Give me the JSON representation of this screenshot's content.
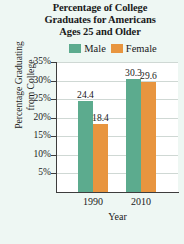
{
  "chart_data": {
    "type": "bar",
    "title": "Percentage of College Graduates for Americans Ages 25 and Older",
    "title_lines": [
      "Percentage of College",
      "Graduates for Americans",
      "Ages 25 and Older"
    ],
    "categories": [
      "1990",
      "2010"
    ],
    "series": [
      {
        "name": "Male",
        "values": [
          24.4,
          18.4
        ],
        "color": "#5cab8e"
      },
      {
        "name": "Female",
        "values": [
          30.3,
          29.6
        ],
        "color": "#e8953f"
      }
    ],
    "bars": [
      {
        "category": "1990",
        "series": "Male",
        "value": 24.4,
        "label": "24.4"
      },
      {
        "category": "1990",
        "series": "Female",
        "value": 18.4,
        "label": "18.4"
      },
      {
        "category": "2010",
        "series": "Male",
        "value": 30.3,
        "label": "30.3"
      },
      {
        "category": "2010",
        "series": "Female",
        "value": 29.6,
        "label": "29.6"
      }
    ],
    "xlabel": "Year",
    "ylabel": "Percentage Graduating from College",
    "ylabel_lines": [
      "Percentage Graduating",
      "from College"
    ],
    "ylim": [
      0,
      35
    ],
    "yticks": [
      "35%",
      "30%",
      "25%",
      "20%",
      "15%",
      "10%",
      "5%"
    ],
    "ytick_values": [
      35,
      30,
      25,
      20,
      15,
      10,
      5
    ],
    "grid": true,
    "legend_position": "top",
    "legend": [
      {
        "label": "Male",
        "color": "#5cab8e"
      },
      {
        "label": "Female",
        "color": "#e8953f"
      }
    ],
    "background_color": "#eef7f3",
    "plot_background_color": "#ffffff"
  }
}
